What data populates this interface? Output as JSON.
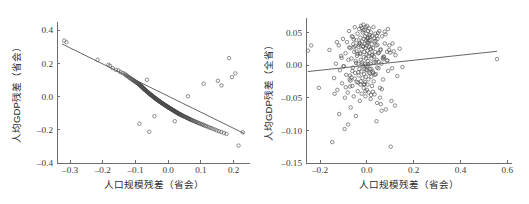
{
  "figure": {
    "background_color": "#ffffff",
    "width": 529,
    "height": 204,
    "panel_count": 2
  },
  "chart_data": [
    {
      "type": "scatter",
      "panel": "left",
      "title": "",
      "xlabel": "人口规模残差（省会）",
      "ylabel": "人均GDP残差（省会）",
      "xlim": [
        -0.34,
        0.25
      ],
      "ylim": [
        -0.4,
        0.45
      ],
      "xticks": [
        -0.3,
        -0.2,
        -0.1,
        0.0,
        0.1,
        0.2
      ],
      "xticklabels": [
        "-0.3",
        "-0.2",
        "-0.1",
        "0.0",
        "0.1",
        "0.2"
      ],
      "yticks": [
        -0.4,
        -0.2,
        0.0,
        0.2,
        0.4
      ],
      "yticklabels": [
        "-0.4",
        "-0.2",
        "0.0",
        "0.2",
        "0.4"
      ],
      "grid": false,
      "legend": null,
      "marker": "open-circle",
      "marker_color": "#4a4a4a",
      "fit_line": {
        "visible": true,
        "color": "#555555",
        "x_start": -0.325,
        "y_start": 0.318,
        "x_end": 0.232,
        "y_end": -0.222,
        "slope": -0.97,
        "intercept": 0.003
      },
      "x": [
        -0.318,
        -0.311,
        -0.216,
        -0.183,
        -0.178,
        -0.17,
        -0.16,
        -0.152,
        -0.146,
        -0.139,
        -0.133,
        -0.13,
        -0.127,
        -0.124,
        -0.12,
        -0.118,
        -0.115,
        -0.112,
        -0.11,
        -0.108,
        -0.106,
        -0.104,
        -0.102,
        -0.1,
        -0.098,
        -0.097,
        -0.095,
        -0.093,
        -0.092,
        -0.09,
        -0.089,
        -0.088,
        -0.087,
        -0.085,
        -0.084,
        -0.083,
        -0.082,
        -0.081,
        -0.08,
        -0.079,
        -0.078,
        -0.077,
        -0.076,
        -0.075,
        -0.074,
        -0.073,
        -0.072,
        -0.071,
        -0.07,
        -0.069,
        -0.068,
        -0.067,
        -0.066,
        -0.065,
        -0.064,
        -0.063,
        -0.062,
        -0.061,
        -0.06,
        -0.059,
        -0.058,
        -0.057,
        -0.056,
        -0.055,
        -0.054,
        -0.053,
        -0.052,
        -0.051,
        -0.05,
        -0.049,
        -0.048,
        -0.047,
        -0.046,
        -0.045,
        -0.044,
        -0.043,
        -0.042,
        -0.041,
        -0.04,
        -0.039,
        -0.038,
        -0.037,
        -0.036,
        -0.035,
        -0.034,
        -0.033,
        -0.032,
        -0.031,
        -0.03,
        -0.029,
        -0.028,
        -0.027,
        -0.026,
        -0.025,
        -0.024,
        -0.023,
        -0.022,
        -0.021,
        -0.02,
        -0.019,
        -0.018,
        -0.017,
        -0.016,
        -0.015,
        -0.014,
        -0.013,
        -0.012,
        -0.011,
        -0.01,
        -0.009,
        -0.008,
        -0.007,
        -0.006,
        -0.005,
        -0.004,
        -0.003,
        -0.002,
        -0.001,
        0.0,
        0.001,
        0.002,
        0.003,
        0.004,
        0.005,
        0.006,
        0.007,
        0.008,
        0.009,
        0.01,
        0.011,
        0.012,
        0.013,
        0.014,
        0.015,
        0.016,
        0.017,
        0.018,
        0.019,
        0.02,
        0.021,
        0.022,
        0.023,
        0.024,
        0.025,
        0.026,
        0.027,
        0.028,
        0.029,
        0.03,
        0.031,
        0.032,
        0.033,
        0.035,
        0.036,
        0.038,
        0.039,
        0.04,
        0.042,
        0.043,
        0.045,
        0.046,
        0.048,
        0.05,
        0.052,
        0.054,
        0.056,
        0.058,
        0.06,
        0.062,
        0.064,
        0.066,
        0.068,
        0.07,
        0.073,
        0.076,
        0.079,
        0.082,
        0.085,
        0.088,
        0.092,
        0.095,
        0.099,
        0.103,
        0.107,
        0.111,
        0.115,
        0.12,
        0.125,
        0.13,
        0.136,
        0.142,
        0.148,
        0.155,
        0.162,
        0.17,
        0.178,
        0.186,
        0.195,
        0.205,
        0.215,
        0.228,
        -0.058,
        -0.065,
        -0.042,
        0.108,
        0.152,
        0.163,
        0.06,
        -0.088,
        0.02,
        -0.006,
        0.035,
        -0.112,
        0.082,
        0.05
      ],
      "y": [
        0.338,
        0.328,
        0.222,
        0.192,
        0.186,
        0.172,
        0.162,
        0.158,
        0.148,
        0.142,
        0.138,
        0.13,
        0.128,
        0.122,
        0.118,
        0.113,
        0.11,
        0.107,
        0.103,
        0.1,
        0.098,
        0.095,
        0.092,
        0.09,
        0.088,
        0.085,
        0.083,
        0.08,
        0.078,
        0.076,
        0.074,
        0.072,
        0.07,
        0.068,
        0.066,
        0.064,
        0.062,
        0.06,
        0.058,
        0.056,
        0.054,
        0.052,
        0.05,
        0.048,
        0.047,
        0.045,
        0.043,
        0.041,
        0.04,
        0.038,
        0.036,
        0.034,
        0.033,
        0.031,
        0.029,
        0.028,
        0.026,
        0.024,
        0.022,
        0.021,
        0.019,
        0.017,
        0.016,
        0.014,
        0.013,
        0.011,
        0.009,
        0.008,
        0.006,
        0.005,
        0.003,
        0.001,
        0.0,
        -0.002,
        -0.003,
        -0.005,
        -0.006,
        -0.008,
        -0.009,
        -0.011,
        -0.012,
        -0.014,
        -0.015,
        -0.017,
        -0.018,
        -0.02,
        -0.021,
        -0.022,
        -0.024,
        -0.025,
        -0.027,
        -0.028,
        -0.029,
        -0.031,
        -0.032,
        -0.034,
        -0.035,
        -0.036,
        -0.038,
        -0.039,
        -0.04,
        -0.042,
        -0.043,
        -0.044,
        -0.046,
        -0.047,
        -0.048,
        -0.05,
        -0.051,
        -0.052,
        -0.054,
        -0.055,
        -0.056,
        -0.057,
        -0.059,
        -0.06,
        -0.061,
        -0.062,
        -0.064,
        -0.065,
        -0.066,
        -0.067,
        -0.069,
        -0.07,
        -0.071,
        -0.072,
        -0.074,
        -0.075,
        -0.076,
        -0.077,
        -0.078,
        -0.08,
        -0.081,
        -0.082,
        -0.083,
        -0.084,
        -0.086,
        -0.087,
        -0.088,
        -0.089,
        -0.09,
        -0.092,
        -0.093,
        -0.094,
        -0.095,
        -0.096,
        -0.098,
        -0.099,
        -0.1,
        -0.101,
        -0.103,
        -0.104,
        -0.105,
        -0.107,
        -0.108,
        -0.11,
        -0.111,
        -0.113,
        -0.114,
        -0.116,
        -0.117,
        -0.119,
        -0.121,
        -0.122,
        -0.124,
        -0.126,
        -0.128,
        -0.13,
        -0.132,
        -0.134,
        -0.136,
        -0.138,
        -0.14,
        -0.142,
        -0.145,
        -0.147,
        -0.15,
        -0.152,
        -0.155,
        -0.158,
        -0.161,
        -0.164,
        -0.167,
        -0.17,
        -0.174,
        -0.177,
        -0.181,
        -0.185,
        -0.189,
        -0.193,
        -0.198,
        -0.203,
        -0.208,
        -0.213,
        -0.219,
        -0.225,
        0.232,
        0.118,
        0.14,
        -0.295,
        -0.215,
        -0.212,
        0.102,
        -0.118,
        0.078,
        0.095,
        0.068,
        0.002,
        -0.163,
        -0.148
      ],
      "n_points": 220,
      "note": "Strong negative linear association; provincial-capital per-capita GDP residual vs population-size residual"
    },
    {
      "type": "scatter",
      "panel": "right",
      "title": "",
      "xlabel": "人口规模残差（省会）",
      "ylabel": "人均GDP残差（全省）",
      "xlim": [
        -0.26,
        0.62
      ],
      "ylim": [
        -0.15,
        0.072
      ],
      "xticks": [
        -0.2,
        0.0,
        0.2,
        0.4,
        0.6
      ],
      "xticklabels": [
        "-0.2",
        "0.0",
        "0.2",
        "0.4",
        "0.6"
      ],
      "yticks": [
        -0.15,
        -0.1,
        -0.05,
        0.0,
        0.05
      ],
      "yticklabels": [
        "-0.15",
        "-0.10",
        "-0.05",
        "0.00",
        "0.05"
      ],
      "grid": false,
      "legend": null,
      "marker": "open-circle",
      "marker_color": "#4a4a4a",
      "fit_line": {
        "visible": true,
        "color": "#555555",
        "x_start": -0.252,
        "y_start": -0.01,
        "x_end": 0.556,
        "y_end": 0.021,
        "slope": 0.038,
        "intercept": -0.0004
      },
      "x": [
        -0.252,
        -0.238,
        -0.205,
        -0.16,
        -0.148,
        -0.14,
        -0.132,
        -0.126,
        -0.12,
        -0.115,
        -0.11,
        -0.106,
        -0.102,
        -0.098,
        -0.094,
        -0.091,
        -0.088,
        -0.085,
        -0.082,
        -0.079,
        -0.076,
        -0.074,
        -0.071,
        -0.069,
        -0.066,
        -0.064,
        -0.062,
        -0.06,
        -0.058,
        -0.056,
        -0.054,
        -0.052,
        -0.05,
        -0.048,
        -0.047,
        -0.045,
        -0.043,
        -0.042,
        -0.04,
        -0.039,
        -0.037,
        -0.036,
        -0.035,
        -0.033,
        -0.032,
        -0.031,
        -0.03,
        -0.029,
        -0.028,
        -0.027,
        -0.026,
        -0.025,
        -0.024,
        -0.023,
        -0.022,
        -0.021,
        -0.02,
        -0.019,
        -0.018,
        -0.017,
        -0.016,
        -0.015,
        -0.014,
        -0.013,
        -0.013,
        -0.012,
        -0.011,
        -0.01,
        -0.01,
        -0.009,
        -0.008,
        -0.008,
        -0.007,
        -0.006,
        -0.006,
        -0.005,
        -0.004,
        -0.004,
        -0.003,
        -0.002,
        -0.002,
        -0.001,
        0.0,
        0.0,
        0.001,
        0.002,
        0.002,
        0.003,
        0.004,
        0.004,
        0.005,
        0.006,
        0.006,
        0.007,
        0.008,
        0.009,
        0.01,
        0.01,
        0.011,
        0.012,
        0.013,
        0.014,
        0.015,
        0.016,
        0.017,
        0.018,
        0.019,
        0.02,
        0.021,
        0.022,
        0.023,
        0.024,
        0.025,
        0.026,
        0.028,
        0.029,
        0.03,
        0.032,
        0.033,
        0.035,
        0.036,
        0.038,
        0.04,
        0.042,
        0.044,
        0.046,
        0.048,
        0.05,
        0.053,
        0.056,
        0.059,
        0.062,
        0.065,
        0.069,
        0.073,
        0.077,
        0.081,
        0.086,
        0.091,
        0.096,
        0.102,
        0.108,
        0.115,
        0.122,
        0.13,
        0.14,
        0.152,
        0.556,
        -0.011,
        0.003,
        -0.02,
        0.014,
        -0.03,
        0.026,
        -0.04,
        0.038,
        -0.052,
        0.048,
        -0.062,
        0.058,
        -0.072,
        0.068,
        0.008,
        -0.005,
        0.018,
        -0.015,
        0.03,
        -0.026,
        0.042,
        -0.036,
        0.052,
        -0.046,
        0.064,
        -0.056,
        0.076,
        -0.066,
        0.086,
        0.002,
        -0.002,
        0.012,
        -0.012,
        0.022,
        -0.022,
        0.034,
        -0.034,
        0.044,
        -0.044,
        0.056,
        -0.056,
        0.07,
        -0.07,
        0.08,
        0.006,
        -0.006,
        0.016,
        -0.016,
        0.027,
        -0.027,
        0.037,
        -0.037,
        0.05,
        -0.05,
        0.06,
        -0.06,
        0.072,
        -0.072,
        0.09,
        -0.09,
        0.1,
        -0.1,
        0.11,
        -0.118,
        0.095,
        -0.138,
        0.088,
        -0.08,
        0.045,
        -0.095,
        0.031,
        0.12,
        -0.108,
        0.063,
        -0.075,
        0.019,
        0.105,
        -0.128,
        0.041
      ],
      "y": [
        0.022,
        0.03,
        -0.035,
        0.023,
        -0.118,
        -0.02,
        0.002,
        -0.038,
        0.03,
        -0.008,
        0.014,
        -0.028,
        0.04,
        -0.002,
        -0.05,
        0.018,
        -0.015,
        0.035,
        -0.042,
        0.008,
        0.052,
        -0.022,
        0.026,
        -0.065,
        0.01,
        0.044,
        -0.032,
        -0.004,
        0.032,
        -0.048,
        0.02,
        0.058,
        -0.012,
        0.006,
        -0.078,
        0.038,
        -0.026,
        0.014,
        0.048,
        -0.04,
        0.002,
        0.028,
        -0.016,
        0.055,
        -0.006,
        0.034,
        -0.055,
        0.018,
        0.042,
        -0.03,
        0.008,
        0.06,
        -0.01,
        0.024,
        -0.044,
        0.036,
        0.004,
        -0.02,
        0.05,
        -0.002,
        0.028,
        0.062,
        -0.035,
        0.012,
        0.04,
        -0.014,
        0.02,
        0.054,
        -0.006,
        0.032,
        -0.026,
        0.044,
        0.002,
        -0.048,
        0.026,
        0.058,
        -0.018,
        0.01,
        0.038,
        -0.008,
        0.048,
        0.016,
        -0.038,
        0.03,
        0.06,
        -0.002,
        0.022,
        -0.03,
        0.042,
        0.006,
        0.052,
        -0.022,
        0.034,
        0.014,
        -0.042,
        0.028,
        0.056,
        -0.012,
        0.018,
        0.046,
        -0.006,
        0.038,
        0.002,
        -0.052,
        0.024,
        0.05,
        -0.018,
        0.01,
        0.032,
        -0.032,
        0.044,
        0.016,
        -0.01,
        0.026,
        0.058,
        -0.025,
        0.004,
        0.036,
        -0.045,
        0.02,
        0.048,
        -0.014,
        0.03,
        0.008,
        -0.058,
        0.04,
        0.018,
        -0.005,
        0.052,
        -0.035,
        0.024,
        0.002,
        0.044,
        -0.022,
        0.012,
        0.033,
        -0.068,
        0.02,
        -0.009,
        0.03,
        -0.125,
        -0.005,
        0.021,
        0.015,
        -0.017,
        0.025,
        -0.003,
        0.009,
        -0.029,
        0.041,
        0.001,
        -0.013,
        0.033,
        -0.041,
        0.017,
        0.005,
        -0.021,
        0.049,
        -0.009,
        0.023,
        -0.033,
        0.011,
        0.037,
        -0.001,
        -0.046,
        0.029,
        0.013,
        -0.025,
        0.045,
        -0.011,
        0.019,
        0.003,
        -0.037,
        0.027,
        0.051,
        -0.019,
        0.007,
        0.035,
        -0.007,
        0.043,
        -0.03,
        0.015,
        0.057,
        -0.015,
        0.031,
        -0.004,
        0.021,
        -0.05,
        0.039,
        0.009,
        -0.024,
        0.047,
        0.001,
        -0.04,
        0.025,
        0.053,
        -0.012,
        0.017,
        0.037,
        -0.027,
        0.005,
        0.029,
        -0.06,
        0.043,
        0.013,
        -0.016,
        0.055,
        -0.034,
        0.019,
        -0.002,
        0.033,
        -0.075,
        0.023,
        -0.044,
        0.007,
        -0.091,
        0.031,
        -0.098,
        0.041,
        -0.062,
        0.011,
        -0.07,
        0.027,
        -0.006,
        -0.055,
        0.035,
        -0.086,
        -0.031,
        0.003,
        -0.123,
        0.015
      ],
      "n_points": 230,
      "note": "Weak positive association; whole-province per-capita GDP residual vs provincial-capital population-size residual"
    }
  ]
}
